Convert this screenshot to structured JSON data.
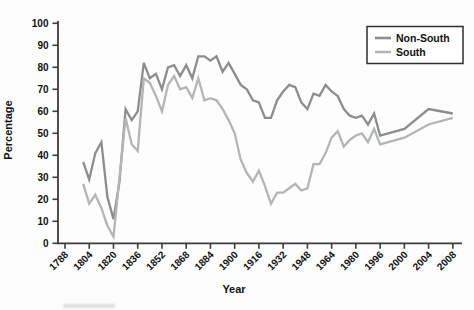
{
  "figure": {
    "background": "#fdfdfd",
    "axis_color": "#3c3c3c",
    "text_color": "#111111"
  },
  "chart_data": {
    "type": "line",
    "title": "",
    "xlabel": "Year",
    "ylabel": "Percentage",
    "ylim": [
      0,
      100
    ],
    "grid": "off",
    "legend_position": "top-right",
    "y_ticks": [
      0,
      10,
      20,
      30,
      40,
      50,
      60,
      70,
      80,
      90,
      100
    ],
    "x_tick_labels": [
      "1788",
      "1804",
      "1820",
      "1836",
      "1852",
      "1868",
      "1884",
      "1900",
      "1916",
      "1932",
      "1948",
      "1964",
      "1980",
      "1996",
      "2000",
      "2004",
      "2008"
    ],
    "x_tick_years": [
      1788,
      1804,
      1820,
      1836,
      1852,
      1868,
      1884,
      1900,
      1916,
      1932,
      1948,
      1964,
      1980,
      1996,
      2000,
      2004,
      2008
    ],
    "x": [
      1800,
      1804,
      1808,
      1812,
      1816,
      1820,
      1824,
      1828,
      1832,
      1836,
      1840,
      1844,
      1848,
      1852,
      1856,
      1860,
      1864,
      1868,
      1872,
      1876,
      1880,
      1884,
      1888,
      1892,
      1896,
      1900,
      1904,
      1908,
      1912,
      1916,
      1920,
      1924,
      1928,
      1932,
      1936,
      1940,
      1944,
      1948,
      1952,
      1956,
      1960,
      1964,
      1968,
      1972,
      1976,
      1980,
      1984,
      1988,
      1992,
      1996,
      2000,
      2004,
      2008
    ],
    "series": [
      {
        "name": "Non-South",
        "color": "#8d8d8d",
        "values": [
          37,
          29,
          41,
          46,
          21,
          11,
          28,
          61,
          56,
          60,
          82,
          75,
          77,
          70,
          80,
          81,
          76,
          81,
          75,
          85,
          85,
          83,
          85,
          78,
          82,
          77,
          72,
          70,
          65,
          64,
          57,
          57,
          65,
          69,
          72,
          71,
          64,
          61,
          68,
          67,
          72,
          69,
          67,
          61,
          58,
          57,
          58,
          54,
          59,
          49,
          52,
          61,
          59
        ]
      },
      {
        "name": "South",
        "color": "#b3b6b6",
        "values": [
          27,
          18,
          22,
          16,
          8,
          3,
          30,
          57,
          45,
          42,
          75,
          73,
          67,
          60,
          72,
          76,
          70,
          71,
          66,
          75,
          65,
          66,
          65,
          61,
          56,
          50,
          38,
          32,
          28,
          33,
          26,
          18,
          23,
          23,
          25,
          27,
          24,
          25,
          36,
          36,
          41,
          48,
          51,
          44,
          47,
          49,
          50,
          46,
          52,
          45,
          48,
          54,
          57
        ]
      }
    ]
  }
}
